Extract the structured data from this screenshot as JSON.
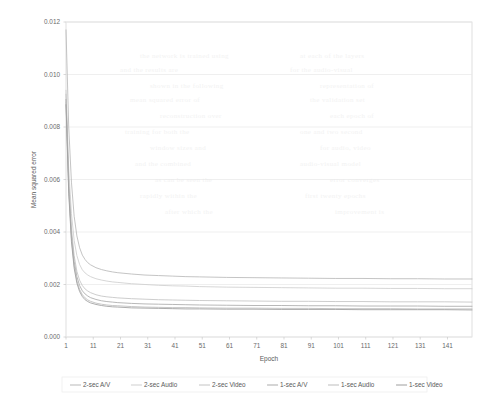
{
  "chart_data": {
    "type": "line",
    "title": "",
    "xlabel": "Epoch",
    "ylabel": "Mean squared error",
    "xlim": [
      1,
      150
    ],
    "ylim": [
      0.0,
      0.012
    ],
    "ytick_labels": [
      "0.012",
      "0.010",
      "0.008",
      "0.006",
      "0.004",
      "0.002",
      "0.000"
    ],
    "ytick_values": [
      0.012,
      0.01,
      0.008,
      0.006,
      0.004,
      0.002,
      0.0
    ],
    "xtick_labels": [
      "1",
      "11",
      "21",
      "31",
      "41",
      "51",
      "61",
      "71",
      "81",
      "91",
      "101",
      "111",
      "121",
      "131",
      "141"
    ],
    "xtick_values": [
      1,
      11,
      21,
      31,
      41,
      51,
      61,
      71,
      81,
      91,
      101,
      111,
      121,
      131,
      141
    ],
    "grid": true,
    "grid_axis": "y",
    "legend_position": "bottom",
    "x": [
      1,
      2,
      3,
      4,
      5,
      6,
      7,
      8,
      9,
      10,
      12,
      14,
      16,
      18,
      20,
      25,
      30,
      35,
      40,
      45,
      50,
      60,
      70,
      80,
      90,
      100,
      110,
      120,
      130,
      140,
      150
    ],
    "series": [
      {
        "name": "2-sec A/V",
        "color": "#b9b9b9",
        "values": [
          0.0117,
          0.008,
          0.0059,
          0.0046,
          0.00385,
          0.0034,
          0.00312,
          0.00295,
          0.00283,
          0.00275,
          0.00264,
          0.00257,
          0.00252,
          0.00248,
          0.00245,
          0.0024,
          0.00236,
          0.00234,
          0.00232,
          0.0023,
          0.00229,
          0.00227,
          0.00226,
          0.00225,
          0.00224,
          0.00223,
          0.00223,
          0.00222,
          0.00222,
          0.00221,
          0.00221
        ]
      },
      {
        "name": "2-sec Audio",
        "color": "#cfcfcf",
        "values": [
          0.0094,
          0.0064,
          0.0047,
          0.00368,
          0.0031,
          0.00276,
          0.00256,
          0.00244,
          0.00236,
          0.0023,
          0.00222,
          0.00217,
          0.00213,
          0.0021,
          0.00208,
          0.00203,
          0.002,
          0.00197,
          0.00195,
          0.00194,
          0.00192,
          0.0019,
          0.00189,
          0.00188,
          0.00187,
          0.00186,
          0.00186,
          0.00185,
          0.00185,
          0.00184,
          0.00184
        ]
      },
      {
        "name": "2-sec Video",
        "color": "#c4c4c4",
        "values": [
          0.00925,
          0.006,
          0.00415,
          0.0031,
          0.0025,
          0.00216,
          0.00196,
          0.00183,
          0.00175,
          0.00169,
          0.00161,
          0.00156,
          0.00153,
          0.00151,
          0.00149,
          0.00146,
          0.00144,
          0.00142,
          0.00141,
          0.0014,
          0.00139,
          0.00138,
          0.00137,
          0.00136,
          0.00136,
          0.00135,
          0.00135,
          0.00134,
          0.00134,
          0.00134,
          0.00133
        ]
      },
      {
        "name": "1-sec A/V",
        "color": "#ababab",
        "values": [
          0.00905,
          0.00575,
          0.0039,
          0.00288,
          0.0023,
          0.00196,
          0.00176,
          0.00164,
          0.00156,
          0.0015,
          0.00143,
          0.00138,
          0.00135,
          0.00133,
          0.00131,
          0.00128,
          0.00126,
          0.00125,
          0.00124,
          0.00123,
          0.00122,
          0.00121,
          0.0012,
          0.0012,
          0.00119,
          0.00119,
          0.00118,
          0.00118,
          0.00118,
          0.00117,
          0.00117
        ]
      },
      {
        "name": "1-sec Audio",
        "color": "#bdbdbd",
        "values": [
          0.00895,
          0.0056,
          0.00375,
          0.00272,
          0.00214,
          0.00181,
          0.00161,
          0.00149,
          0.00141,
          0.00136,
          0.00129,
          0.00125,
          0.00122,
          0.0012,
          0.00119,
          0.00116,
          0.00114,
          0.00113,
          0.00112,
          0.00112,
          0.00111,
          0.0011,
          0.0011,
          0.00109,
          0.00109,
          0.00108,
          0.00108,
          0.00108,
          0.00107,
          0.00107,
          0.00107
        ]
      },
      {
        "name": "1-sec Video",
        "color": "#9e9e9e",
        "values": [
          0.00885,
          0.00548,
          0.00363,
          0.00262,
          0.00205,
          0.00173,
          0.00154,
          0.00142,
          0.00135,
          0.0013,
          0.00124,
          0.0012,
          0.00117,
          0.00115,
          0.00114,
          0.00111,
          0.0011,
          0.00109,
          0.00108,
          0.00107,
          0.00107,
          0.00106,
          0.00106,
          0.00105,
          0.00105,
          0.00105,
          0.00104,
          0.00104,
          0.00104,
          0.00104,
          0.00103
        ]
      }
    ]
  },
  "ghost_text": [
    {
      "t": "the network is trained using",
      "x": 140,
      "y": 52
    },
    {
      "t": "at each of the layers",
      "x": 300,
      "y": 52
    },
    {
      "t": "and the results are",
      "x": 120,
      "y": 66
    },
    {
      "t": "for the audio-visual",
      "x": 290,
      "y": 66
    },
    {
      "t": "shown in the following",
      "x": 150,
      "y": 82
    },
    {
      "t": "representation of",
      "x": 320,
      "y": 82
    },
    {
      "t": "mean squared error of",
      "x": 130,
      "y": 96
    },
    {
      "t": "the validation set",
      "x": 310,
      "y": 96
    },
    {
      "t": "reconstruction over",
      "x": 160,
      "y": 112
    },
    {
      "t": "each epoch of",
      "x": 330,
      "y": 112
    },
    {
      "t": "training for both the",
      "x": 125,
      "y": 128
    },
    {
      "t": "one and two second",
      "x": 300,
      "y": 128
    },
    {
      "t": "window sizes and",
      "x": 150,
      "y": 144
    },
    {
      "t": "for audio, video",
      "x": 320,
      "y": 144
    },
    {
      "t": "and the combined",
      "x": 135,
      "y": 160
    },
    {
      "t": "audio-visual model",
      "x": 300,
      "y": 160
    },
    {
      "t": "as can be seen the",
      "x": 155,
      "y": 176
    },
    {
      "t": "error converges",
      "x": 330,
      "y": 176
    },
    {
      "t": "rapidly within the",
      "x": 140,
      "y": 192
    },
    {
      "t": "first twenty epochs",
      "x": 305,
      "y": 192
    },
    {
      "t": "after which the",
      "x": 165,
      "y": 208
    },
    {
      "t": "improvement is",
      "x": 335,
      "y": 208
    }
  ]
}
